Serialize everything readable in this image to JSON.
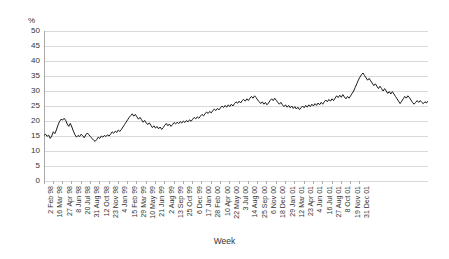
{
  "chart_data": {
    "type": "line",
    "title": "",
    "subtitle": "",
    "xlabel": "Week",
    "ylabel": "%",
    "ylim": [
      0,
      50
    ],
    "ytick_step": 5,
    "yticks": [
      50,
      45,
      40,
      35,
      30,
      25,
      20,
      15,
      10,
      5,
      0
    ],
    "grid": true,
    "legend": "none",
    "line_color": "#1a1a1a",
    "grid_color": "#d9d9d9",
    "background": "#ffffff",
    "x_tick_interval_weeks": 6,
    "x_tick_labels": [
      "2 Feb 98",
      "16 Mar 98",
      "27 Apr 98",
      "8 Jun 98",
      "20 Jul 98",
      "31 Aug 98",
      "12 Oct 98",
      "23 Nov 98",
      "4 Jan 99",
      "15 Feb 99",
      "29 Mar 99",
      "10 May 99",
      "21 Jun 99",
      "2 Aug 99",
      "13 Sep 99",
      "25 Oct 99",
      "6 Dec 99",
      "17 Jan 00",
      "28 Feb 00",
      "10 Apr 00",
      "22 May 00",
      "3 Jul 00",
      "14 Aug 00",
      "25 Sep 00",
      "6 Nov 00",
      "18 Dec 00",
      "29 Jan 01",
      "12 Mar 01",
      "23 Apr 01",
      "4 Jun 01",
      "16 Jul 01",
      "27 Aug 01",
      "8 Oct 01",
      "19 Nov 01",
      "31 Dec 01"
    ],
    "x_start": "2 Feb 98",
    "x_end": "31 Dec 01",
    "series": [
      {
        "name": "percentage",
        "values": [
          15.2,
          15.6,
          14.9,
          15.3,
          14.2,
          15.0,
          16.4,
          15.8,
          17.0,
          18.6,
          19.8,
          20.6,
          20.3,
          20.9,
          20.2,
          19.0,
          18.2,
          19.2,
          18.0,
          16.6,
          15.4,
          14.6,
          15.2,
          14.8,
          15.6,
          15.1,
          14.4,
          15.4,
          16.0,
          15.4,
          14.8,
          14.2,
          13.6,
          13.2,
          13.8,
          14.6,
          14.2,
          15.0,
          14.6,
          15.2,
          14.8,
          15.4,
          15.0,
          15.6,
          16.4,
          15.9,
          16.6,
          16.2,
          17.0,
          16.5,
          17.2,
          18.0,
          18.8,
          19.6,
          20.4,
          21.2,
          21.8,
          22.4,
          21.6,
          22.2,
          21.4,
          20.6,
          21.2,
          20.4,
          19.6,
          20.2,
          19.4,
          18.8,
          19.4,
          18.6,
          17.8,
          18.4,
          17.6,
          18.2,
          17.4,
          18.0,
          17.2,
          17.8,
          18.6,
          19.2,
          18.4,
          19.0,
          18.2,
          18.8,
          19.5,
          19.0,
          19.6,
          19.1,
          19.8,
          19.3,
          20.0,
          19.5,
          20.2,
          19.7,
          20.4,
          19.9,
          20.6,
          21.2,
          20.7,
          21.4,
          20.9,
          21.6,
          22.2,
          21.7,
          22.4,
          23.0,
          22.5,
          23.2,
          22.7,
          23.4,
          24.0,
          23.5,
          24.2,
          23.7,
          24.4,
          25.0,
          24.5,
          25.2,
          24.6,
          25.4,
          24.8,
          25.6,
          25.0,
          25.8,
          26.4,
          25.9,
          26.6,
          26.0,
          26.8,
          27.2,
          26.6,
          27.4,
          26.8,
          27.6,
          28.2,
          27.6,
          28.4,
          27.8,
          27.0,
          26.4,
          25.8,
          26.4,
          25.6,
          26.2,
          25.4,
          26.0,
          26.8,
          27.4,
          26.8,
          27.6,
          26.9,
          26.2,
          25.6,
          26.2,
          25.4,
          24.8,
          25.4,
          24.6,
          25.2,
          24.4,
          25.0,
          24.2,
          24.8,
          24.0,
          24.6,
          23.8,
          24.4,
          25.0,
          24.4,
          25.2,
          24.6,
          25.4,
          24.8,
          25.6,
          25.0,
          25.8,
          25.2,
          26.0,
          25.4,
          26.2,
          25.6,
          26.4,
          27.0,
          26.4,
          27.2,
          26.6,
          27.4,
          26.8,
          27.6,
          28.4,
          27.8,
          28.6,
          27.9,
          28.8,
          28.0,
          27.4,
          28.2,
          27.6,
          28.4,
          29.2,
          30.0,
          31.2,
          32.4,
          33.6,
          34.6,
          35.4,
          36.0,
          35.2,
          34.4,
          33.6,
          34.2,
          33.4,
          32.6,
          31.8,
          32.4,
          31.6,
          30.8,
          31.6,
          30.8,
          30.0,
          30.8,
          30.0,
          29.2,
          29.8,
          29.0,
          29.8,
          29.0,
          28.2,
          27.4,
          26.6,
          25.8,
          26.6,
          27.4,
          28.2,
          27.6,
          28.4,
          27.8,
          27.0,
          26.2,
          25.6,
          26.2,
          26.8,
          26.2,
          26.8,
          26.2,
          25.8,
          26.4,
          26.0,
          26.6
        ]
      }
    ]
  }
}
